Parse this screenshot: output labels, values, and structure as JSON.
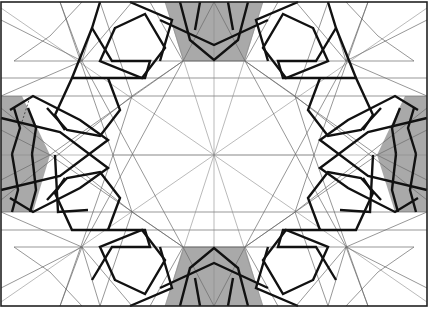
{
  "figure": {
    "width": 431,
    "height": 313,
    "colors": {
      "background": "#ffffff",
      "construction_line": "#6a6a6a",
      "strapwork": "#111111",
      "shaded_region": "#a9a9a9",
      "frame": "#222222"
    },
    "frame": {
      "x": 1,
      "y": 2,
      "w": 426,
      "h": 304
    },
    "center": [
      214,
      155
    ],
    "horizontal_guides_y": [
      61,
      78,
      96,
      155,
      212,
      230,
      247
    ],
    "rosette_nodes": [
      [
        82,
        61
      ],
      [
        132,
        96
      ],
      [
        50,
        155
      ],
      [
        113,
        155
      ],
      [
        132,
        212
      ],
      [
        82,
        247
      ],
      [
        183,
        61
      ],
      [
        245,
        61
      ],
      [
        183,
        247
      ],
      [
        245,
        247
      ],
      [
        295,
        96
      ],
      [
        346,
        61
      ],
      [
        314,
        155
      ],
      [
        377,
        155
      ],
      [
        295,
        212
      ],
      [
        346,
        247
      ]
    ],
    "shaded_regions": [
      "top-center",
      "bottom-center",
      "left-middle",
      "right-middle"
    ]
  }
}
